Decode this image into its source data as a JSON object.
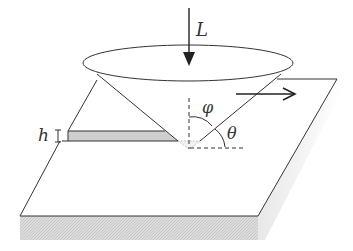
{
  "diagram": {
    "labels": {
      "load": "L",
      "depth": "h",
      "half_angle": "φ",
      "attack_angle": "θ"
    },
    "colors": {
      "line": "#333333",
      "groove_fill": "#c8c8c8",
      "side_fill": "#d4d4d4",
      "shadow": "#e6e6e6",
      "background": "#ffffff"
    }
  }
}
